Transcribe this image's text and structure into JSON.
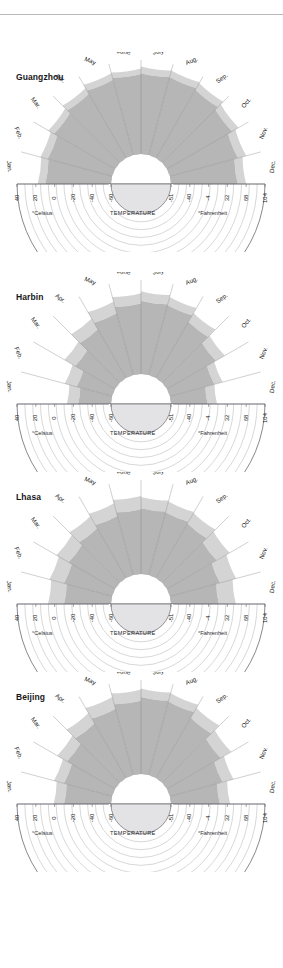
{
  "page": {
    "background": "#ffffff",
    "width": 283,
    "height": 968,
    "rule_color": "#b9b9bd"
  },
  "axis": {
    "celsius_caption": "°Celsius",
    "fahrenheit_caption": "°Fahrenheit",
    "temperature_caption": "TEMPERATURE",
    "celsius_ticks": [
      "40",
      "20",
      "0",
      "-20",
      "-40",
      "-60"
    ],
    "fahrenheit_ticks": [
      "-51",
      "-40",
      "-4",
      "32",
      "68",
      "104"
    ],
    "months": [
      "Jan.",
      "Feb.",
      "Mar.",
      "Apr.",
      "May",
      "June",
      "July",
      "Aug.",
      "Sep.",
      "Oct.",
      "Nov.",
      "Dec."
    ]
  },
  "style": {
    "grid_color": "#7d7d85",
    "outline_color": "#55555c",
    "inner_disc_fill": "#e3e3e5",
    "inner_disc_ring": "#ffffff",
    "band_shades": [
      "#ffffff",
      "#f2f2f2",
      "#e4e4e4",
      "#d4d4d4",
      "#c4c4c4",
      "#b6b6b6",
      "#ababab"
    ]
  },
  "chart_data": {
    "type": "polar_area",
    "xlabel": "TEMPERATURE",
    "ylabel": "",
    "angular_categories": [
      "Jan.",
      "Feb.",
      "Mar.",
      "Apr.",
      "May",
      "June",
      "July",
      "Aug.",
      "Sep.",
      "Oct.",
      "Nov.",
      "Dec."
    ],
    "radial_axis": {
      "celsius_ticks": [
        40,
        20,
        0,
        -20,
        -40,
        -60
      ],
      "fahrenheit_ticks": [
        -51,
        -40,
        -4,
        32,
        68,
        104
      ],
      "celsius_outer": 40,
      "celsius_inner": -60,
      "note": "Radius decreases outward-to-inward from 40°C at the rim to -60°C at the centre disc"
    },
    "legend_position": "none",
    "grid": true,
    "panels": [
      {
        "name": "Guangzhou",
        "series": [
          {
            "name": "monthly high (°C)",
            "values": [
              18,
              19,
              22,
              26,
              30,
              31,
              33,
              33,
              32,
              28,
              24,
              20
            ]
          },
          {
            "name": "monthly low (°C)",
            "values": [
              10,
              11,
              15,
              19,
              23,
              25,
              26,
              26,
              24,
              20,
              15,
              11
            ]
          }
        ]
      },
      {
        "name": "Harbin",
        "series": [
          {
            "name": "monthly high (°C)",
            "values": [
              -13,
              -8,
              2,
              13,
              21,
              26,
              28,
              26,
              20,
              11,
              -2,
              -11
            ]
          },
          {
            "name": "monthly low (°C)",
            "values": [
              -25,
              -21,
              -11,
              0,
              8,
              15,
              18,
              17,
              9,
              0,
              -11,
              -21
            ]
          }
        ]
      },
      {
        "name": "Lhasa",
        "series": [
          {
            "name": "monthly high (°C)",
            "values": [
              7,
              9,
              12,
              16,
              19,
              23,
              22,
              21,
              20,
              17,
              13,
              9
            ]
          },
          {
            "name": "monthly low (°C)",
            "values": [
              -10,
              -7,
              -3,
              1,
              5,
              9,
              10,
              9,
              7,
              1,
              -5,
              -9
            ]
          }
        ]
      },
      {
        "name": "Beijing",
        "series": [
          {
            "name": "monthly high (°C)",
            "values": [
              1,
              4,
              11,
              20,
              26,
              30,
              31,
              30,
              26,
              19,
              10,
              3
            ]
          },
          {
            "name": "monthly low (°C)",
            "values": [
              -10,
              -7,
              -1,
              7,
              13,
              18,
              22,
              21,
              14,
              6,
              -2,
              -8
            ]
          }
        ]
      }
    ]
  }
}
